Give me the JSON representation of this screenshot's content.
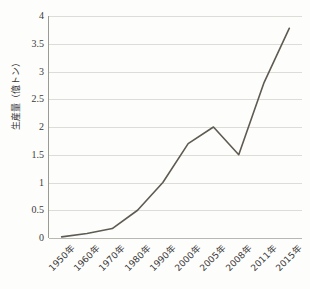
{
  "chart_data": {
    "type": "line",
    "title": "",
    "xlabel": "",
    "ylabel": "生産量（億トン）",
    "categories": [
      "1950年",
      "1960年",
      "1970年",
      "1980年",
      "1990年",
      "2000年",
      "2005年",
      "2008年",
      "2011年",
      "2015年"
    ],
    "values": [
      0.02,
      0.08,
      0.17,
      0.5,
      1.0,
      1.7,
      2.0,
      1.5,
      2.8,
      3.78
    ],
    "series": [
      {
        "name": "生産量",
        "values": [
          0.02,
          0.08,
          0.17,
          0.5,
          1.0,
          1.7,
          2.0,
          1.5,
          2.8,
          3.78
        ]
      }
    ],
    "ylim": [
      0,
      4
    ],
    "ytick_labels": [
      "0",
      "0.5",
      "1",
      "1.5",
      "2",
      "2.5",
      "3",
      "3.5",
      "4"
    ],
    "ytick_values": [
      0,
      0.5,
      1,
      1.5,
      2,
      2.5,
      3,
      3.5,
      4
    ],
    "grid": true,
    "grid_axis": "y",
    "legend": false,
    "legend_position": "none",
    "line_color": "#5f5b52",
    "grid_color": "#dedcd6",
    "axis_color": "#9a9a96",
    "background_color": "#fdfdfb",
    "text_color": "#3a3a3a"
  }
}
